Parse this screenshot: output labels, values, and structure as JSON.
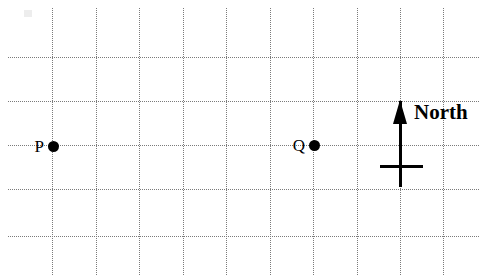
{
  "figure": {
    "width": 491,
    "height": 277,
    "background_color": "#ffffff",
    "ink_color": "#000000",
    "grid_color": "#7a7a7a"
  },
  "grid": {
    "style": "dotted",
    "spacing_px": 43.5,
    "vertical_line_x": [
      52,
      96,
      139,
      183,
      226,
      270,
      313,
      357,
      400,
      443
    ],
    "horizontal_line_y": [
      57,
      101,
      145,
      189,
      236
    ],
    "horizontal_extent_x": [
      8,
      479
    ],
    "vertical_extent_y": [
      8,
      275
    ]
  },
  "points": [
    {
      "label": "P",
      "x": 53,
      "y": 146,
      "label_position": "left",
      "marker": "filled-circle"
    },
    {
      "label": "Q",
      "x": 314,
      "y": 145,
      "label_position": "left",
      "marker": "filled-circle"
    }
  ],
  "north_indicator": {
    "label": "North",
    "arrow_direction": "up",
    "arrow_tip_x": 400,
    "arrow_tip_y": 101,
    "arrow_base_y": 187,
    "crossbar_y": 167,
    "crossbar_x_start": 380,
    "crossbar_x_end": 423,
    "label_x": 414,
    "label_y": 102
  },
  "artifacts": {
    "scan_smudge": {
      "x": 24,
      "y": 10,
      "width": 8,
      "height": 7
    }
  }
}
